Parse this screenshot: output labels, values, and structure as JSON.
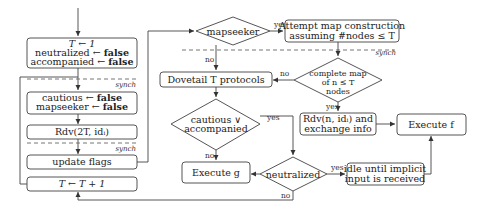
{
  "diagram": {
    "left_column": {
      "init_box": {
        "line1": "T ← 1",
        "line2_var": "neutralized ← ",
        "line2_val": "false",
        "line3_var": "accompanied ← ",
        "line3_val": "false"
      },
      "reset_box": {
        "line1_var": "cautious ← ",
        "line1_val": "false",
        "line2_var": "mapseeker ← ",
        "line2_val": "false"
      },
      "rdv_box": {
        "label": "Rdv(2T, idᵢ)"
      },
      "update_box": {
        "label": "update flags"
      },
      "increment_box": {
        "label": "T ← T + 1"
      }
    },
    "middle_column": {
      "mapseeker_diamond": {
        "label": "mapseeker"
      },
      "dovetail_box": {
        "label": "Dovetail T protocols"
      },
      "cautious_diamond": {
        "line1": "cautious ∨",
        "line2": "accompanied"
      },
      "execute_g_box": {
        "label": "Execute g"
      },
      "neutralized_diamond": {
        "label": "neutralized"
      }
    },
    "right_column": {
      "attempt_box": {
        "line1": "Attempt map construction",
        "line2": "assuming #nodes ≤ T"
      },
      "complete_diamond": {
        "line1": "complete map",
        "line2": "of n ≤ T",
        "line3": "nodes"
      },
      "rdv_exchange_box": {
        "line1": "Rdv(n, idᵢ) and",
        "line2": "exchange info"
      },
      "idle_box": {
        "line1": "idle until implicit",
        "line2": "input is received"
      },
      "execute_f_box": {
        "label": "Execute f"
      }
    },
    "edge_labels": {
      "yes": "yes",
      "no": "no",
      "synch": "synch"
    }
  }
}
